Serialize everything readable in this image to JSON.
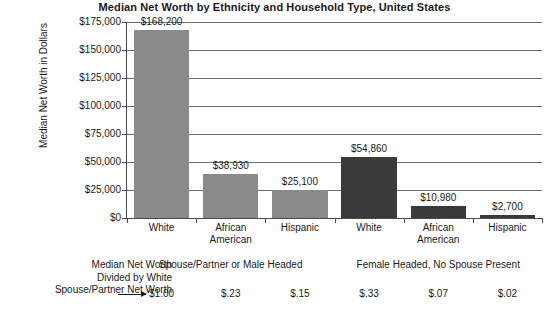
{
  "chart_data": {
    "type": "bar",
    "title": "Median Net Worth by Ethnicity and Household Type, United States",
    "xlabel": "",
    "ylabel": "Median Net Worth in Dollars",
    "ylim": [
      0,
      175000
    ],
    "ytick_values": [
      0,
      25000,
      50000,
      75000,
      100000,
      125000,
      150000,
      175000
    ],
    "ytick_labels": [
      "$0",
      "$25,000",
      "$50,000",
      "$75,000",
      "$100,000",
      "$125,000",
      "$150,000",
      "$175,000"
    ],
    "grid": true,
    "legend": "none",
    "categories": [
      "White",
      "African American",
      "Hispanic",
      "White",
      "African American",
      "Hispanic"
    ],
    "category_lines": [
      [
        "White"
      ],
      [
        "African",
        "American"
      ],
      [
        "Hispanic"
      ],
      [
        "White"
      ],
      [
        "African",
        "American"
      ],
      [
        "Hispanic"
      ]
    ],
    "values": [
      168200,
      38930,
      25100,
      54860,
      10980,
      2700
    ],
    "value_labels": [
      "$168,200",
      "$38,930",
      "$25,100",
      "$54,860",
      "$10,980",
      "$2,700"
    ],
    "bar_colors": [
      "#8a8a8a",
      "#8a8a8a",
      "#8a8a8a",
      "#3a3a3a",
      "#3a3a3a",
      "#3a3a3a"
    ],
    "groups": [
      {
        "label": "Spouse/Partner or Male Headed",
        "categories": [
          0,
          1,
          2
        ]
      },
      {
        "label": "Female Headed, No Spouse Present",
        "categories": [
          3,
          4,
          5
        ]
      }
    ],
    "annotation": {
      "caption_lines": [
        "Median Net Worth",
        "Divided by White",
        "Spouse/Partner Net Worth"
      ],
      "ratio_labels": [
        "$1.00",
        "$.23",
        "$.15",
        "$.33",
        "$.07",
        "$.02"
      ],
      "ratio_values": [
        1.0,
        0.23,
        0.15,
        0.33,
        0.07,
        0.02
      ]
    }
  },
  "colors": {
    "light_bar": "#8a8a8a",
    "dark_bar": "#3a3a3a",
    "gridline": "#6e6e6e",
    "axis": "#4a4a4a",
    "text": "#1a1a1a",
    "background": "#ffffff"
  }
}
